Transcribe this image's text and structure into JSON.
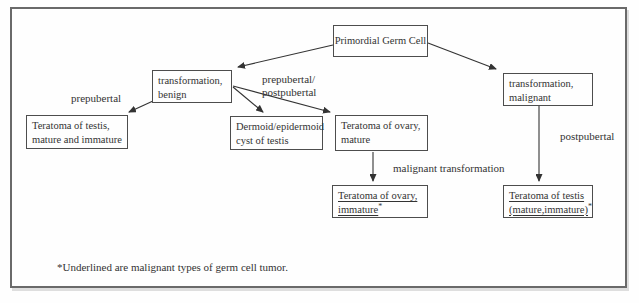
{
  "nodes": {
    "primordial": {
      "label": "Primordial Germ Cell"
    },
    "benign": {
      "line1": "transformation,",
      "line2": "benign"
    },
    "malignant": {
      "line1": "transformation,",
      "line2": "malignant"
    },
    "testis_benign": {
      "line1": "Teratoma of testis,",
      "line2": "mature and immature"
    },
    "dermoid": {
      "line1": "Dermoid/epidermoid",
      "line2": "cyst of testis"
    },
    "ovary_mature": {
      "line1": "Teratoma of ovary,",
      "line2": "mature"
    },
    "ovary_immature": {
      "line1": "Teratoma of ovary,",
      "line2": "immature",
      "superscript": "*"
    },
    "testis_malignant": {
      "line1": "Teratoma of testis",
      "line2": "(mature,immature)",
      "superscript": "*"
    }
  },
  "edge_labels": {
    "prepubertal": "prepubertal",
    "prepub_postpub_line1": "prepubertal/",
    "prepub_postpub_line2": "postpubertal",
    "postpubertal": "postpubertal",
    "malignant_transformation": "malignant transformation"
  },
  "footnote": "*Underlined are malignant types of germ cell tumor.",
  "colors": {
    "frame_border": "#6a6a6a",
    "box_border": "#4d4d4d",
    "text": "#333333",
    "arrow": "#333333",
    "background": "#fefefe"
  }
}
